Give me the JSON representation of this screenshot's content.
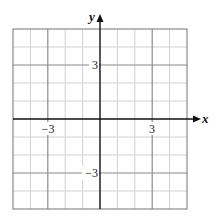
{
  "graph": {
    "type": "cartesian-grid",
    "x_axis": {
      "label": "x",
      "min": -5,
      "max": 5
    },
    "y_axis": {
      "label": "y",
      "min": -5,
      "max": 5
    },
    "grid_step": 1,
    "major_step": 3,
    "tick_labels": {
      "x": [
        {
          "value": -3,
          "text": "−3"
        },
        {
          "value": 3,
          "text": "3"
        }
      ],
      "y": [
        {
          "value": 3,
          "text": "3"
        },
        {
          "value": -3,
          "text": "−3"
        }
      ]
    },
    "colors": {
      "minor_grid": "#d2d2d2",
      "major_grid": "#8a8a8a",
      "border": "#8a8a8a",
      "axis": "#111111"
    }
  }
}
